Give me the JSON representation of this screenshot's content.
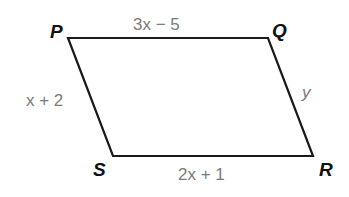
{
  "figure": {
    "shape": "parallelogram",
    "stroke_color": "#1a1a1a",
    "label_color": "#7a7a7a",
    "vertices": {
      "P": {
        "label": "P"
      },
      "Q": {
        "label": "Q"
      },
      "R": {
        "label": "R"
      },
      "S": {
        "label": "S"
      }
    },
    "sides": {
      "PQ": "3x − 5",
      "QR": "y",
      "SR": "2x + 1",
      "PS": "x + 2"
    }
  }
}
